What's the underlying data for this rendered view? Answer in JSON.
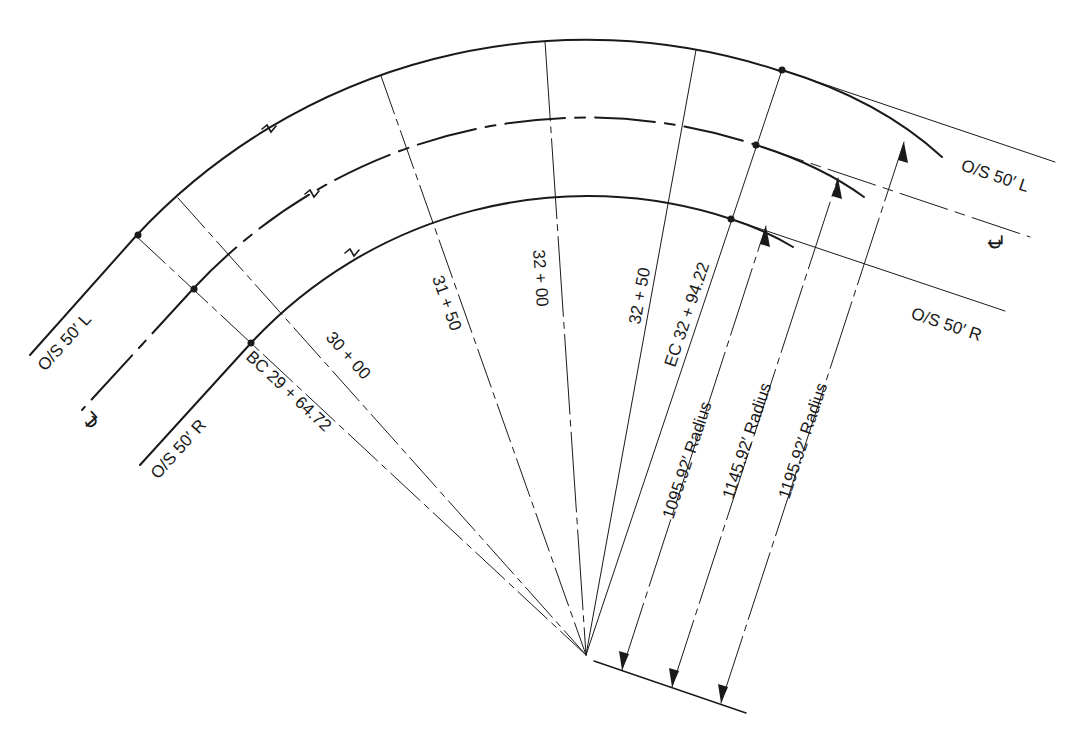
{
  "diagram": {
    "type": "horizontal-curve-layout",
    "center": {
      "x": 586,
      "y": 655
    },
    "curves": [
      {
        "id": "os-left",
        "label": "O/S 50′ L",
        "radius_label": "1195.92′ Radius",
        "radius_px": 615,
        "style": "solid"
      },
      {
        "id": "centerline",
        "label": "℄",
        "radius_label": "1145.92′ Radius",
        "radius_px": 537,
        "style": "dash-dot"
      },
      {
        "id": "os-right",
        "label": "O/S 50′ R",
        "radius_label": "1095.92′ Radius",
        "radius_px": 459,
        "style": "solid"
      }
    ],
    "bc": {
      "label": "BC  29 + 64.72",
      "angle_deg": -47
    },
    "ec": {
      "label": "EC 32 + 94.22",
      "angle_deg": 18.4
    },
    "stations": [
      {
        "label": "30 + 00",
        "angle_deg": -41.8
      },
      {
        "label": "31 + 50",
        "angle_deg": -19.5
      },
      {
        "label": "32 + 00",
        "angle_deg": -3.8
      },
      {
        "label": "32 + 50",
        "angle_deg": 10.3
      }
    ],
    "labels": {
      "left_os_l": "O/S 50′ L",
      "left_cl": "℄",
      "left_os_r": "O/S 50′ R",
      "right_os_l": "O/S 50′ L",
      "right_cl": "℄",
      "right_os_r": "O/S 50′ R",
      "bc_station": "BC  29 + 64.72",
      "ec_station": "EC 32 + 94.22",
      "sta_3000": "30 + 00",
      "sta_3150": "31 + 50",
      "sta_3200": "32 + 00",
      "sta_3250": "32 + 50",
      "radius_inner": "1095.92′ Radius",
      "radius_cl": "1145.92′ Radius",
      "radius_outer": "1195.92′ Radius"
    },
    "colors": {
      "ink": "#1a1a1a",
      "paper": "#ffffff"
    }
  }
}
